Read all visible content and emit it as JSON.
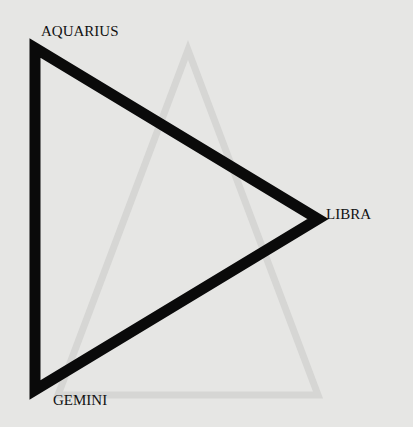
{
  "diagram": {
    "type": "triangle",
    "vertices": [
      {
        "label": "AQUARIUS",
        "x": 32,
        "y": 48
      },
      {
        "label": "LIBRA",
        "x": 318,
        "y": 219
      },
      {
        "label": "GEMINI",
        "x": 35,
        "y": 390
      }
    ],
    "stroke_color": "#0a0a0a",
    "background_color": "#e6e6e4"
  }
}
